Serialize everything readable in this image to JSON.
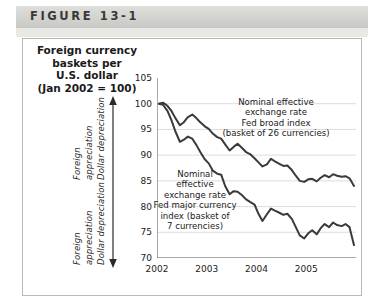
{
  "figure": {
    "banner_label": "FIGURE 13-1",
    "title_lines": [
      "Foreign currency",
      "baskets per",
      "U.S. dollar",
      "(Jan 2002 = 100)"
    ]
  },
  "side_labels": {
    "upper": {
      "line1": "Foreign",
      "line2": "appreciation",
      "line3": "Dollar depreciation",
      "arrow": "up-arrow"
    },
    "lower": {
      "line1": "Foreign",
      "line2": "appreciation",
      "line3": "Dollar depreciation",
      "arrow": "down-arrow"
    }
  },
  "chart_data": {
    "type": "line",
    "title": "Foreign currency baskets per U.S. dollar (Jan 2002 = 100)",
    "xlabel": "",
    "ylabel": "",
    "ylim": [
      70,
      105
    ],
    "yticks": [
      70,
      75,
      80,
      85,
      90,
      95,
      100,
      105
    ],
    "xlim": [
      2002.0,
      2006.0
    ],
    "xticks": [
      2002,
      2003,
      2004,
      2005
    ],
    "xtick_labels": [
      "2002",
      "2003",
      "2004",
      "2005"
    ],
    "grid": "horizontal",
    "legend": "annotations",
    "line_color": "#3a3a3a",
    "series": [
      {
        "name": "Nominal effective exchange rate Fed broad index (basket of 26 currencies)",
        "short_name": "Fed broad index",
        "annotation_lines": [
          "Nominal effective",
          "exchange rate",
          "Fed broad index",
          "(basket of 26 currencies)"
        ],
        "x": [
          2002.04,
          2002.12,
          2002.21,
          2002.29,
          2002.37,
          2002.46,
          2002.54,
          2002.62,
          2002.71,
          2002.79,
          2002.87,
          2002.96,
          2003.04,
          2003.12,
          2003.21,
          2003.29,
          2003.37,
          2003.46,
          2003.54,
          2003.62,
          2003.71,
          2003.79,
          2003.87,
          2003.96,
          2004.04,
          2004.12,
          2004.21,
          2004.29,
          2004.37,
          2004.46,
          2004.54,
          2004.62,
          2004.71,
          2004.79,
          2004.87,
          2004.96,
          2005.04,
          2005.12,
          2005.21,
          2005.29,
          2005.37,
          2005.46,
          2005.54,
          2005.62,
          2005.71,
          2005.79,
          2005.87,
          2005.96
        ],
        "values": [
          100.0,
          100.2,
          99.6,
          98.6,
          97.2,
          95.8,
          96.4,
          97.4,
          97.9,
          97.2,
          96.4,
          95.6,
          95.1,
          94.2,
          93.5,
          93.2,
          92.1,
          90.9,
          91.6,
          92.2,
          91.4,
          90.6,
          90.2,
          89.4,
          88.6,
          87.8,
          88.2,
          89.3,
          88.8,
          88.3,
          87.9,
          88.0,
          87.1,
          86.0,
          85.0,
          84.8,
          85.3,
          85.4,
          84.9,
          85.6,
          86.1,
          85.7,
          86.3,
          86.0,
          85.8,
          85.9,
          85.5,
          84.0
        ]
      },
      {
        "name": "Nominal effective exchange rate Fed major currency index (basket of 7 currencies)",
        "short_name": "Fed major currency index",
        "annotation_lines": [
          "Nominal",
          "effective",
          "exchange rate",
          "Fed major currency",
          "index (basket of",
          "7 currencies)"
        ],
        "x": [
          2002.04,
          2002.12,
          2002.21,
          2002.29,
          2002.37,
          2002.46,
          2002.54,
          2002.62,
          2002.71,
          2002.79,
          2002.87,
          2002.96,
          2003.04,
          2003.12,
          2003.21,
          2003.29,
          2003.37,
          2003.46,
          2003.54,
          2003.62,
          2003.71,
          2003.79,
          2003.87,
          2003.96,
          2004.04,
          2004.12,
          2004.21,
          2004.29,
          2004.37,
          2004.46,
          2004.54,
          2004.62,
          2004.71,
          2004.79,
          2004.87,
          2004.96,
          2005.04,
          2005.12,
          2005.21,
          2005.29,
          2005.37,
          2005.46,
          2005.54,
          2005.62,
          2005.71,
          2005.79,
          2005.87,
          2005.96
        ],
        "values": [
          100.0,
          99.8,
          98.6,
          96.8,
          94.6,
          92.6,
          93.0,
          93.6,
          93.2,
          92.0,
          90.6,
          89.2,
          88.4,
          87.0,
          86.4,
          86.2,
          84.0,
          82.4,
          83.0,
          82.9,
          82.2,
          81.4,
          80.9,
          80.4,
          78.6,
          77.2,
          78.5,
          79.6,
          79.2,
          78.8,
          78.4,
          78.6,
          77.6,
          76.0,
          74.4,
          73.8,
          74.8,
          75.4,
          74.6,
          75.8,
          76.6,
          76.0,
          76.9,
          76.4,
          76.2,
          76.6,
          76.0,
          72.5
        ]
      }
    ]
  }
}
